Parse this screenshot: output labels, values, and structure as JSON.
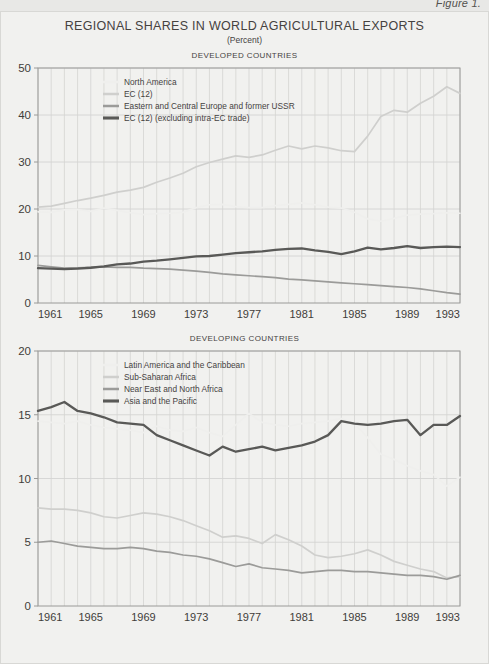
{
  "figure_label": "Figure 1.",
  "title": "REGIONAL SHARES IN WORLD AGRICULTURAL EXPORTS",
  "subtitle": "(Percent)",
  "colors": {
    "very_light": "#efefed",
    "light": "#cfcfcd",
    "medium": "#9b9b99",
    "dark": "#595957",
    "grid": "#d4d4d2",
    "axis": "#9a9a98",
    "text": "#3f3d3a",
    "background": "#f1f1ef",
    "page": "#e8e8e6"
  },
  "chart_data": [
    {
      "type": "line",
      "title": "DEVELOPED COUNTRIES",
      "xlabel": "",
      "ylabel": "",
      "xlim": [
        1961,
        1993
      ],
      "ylim": [
        0,
        50
      ],
      "yticks": [
        0,
        10,
        20,
        30,
        40,
        50
      ],
      "xticks": [
        1961,
        1965,
        1969,
        1973,
        1977,
        1981,
        1985,
        1989,
        1993
      ],
      "grid": true,
      "legend_position": "top-left-inside",
      "x": [
        1961,
        1962,
        1963,
        1964,
        1965,
        1966,
        1967,
        1968,
        1969,
        1970,
        1971,
        1972,
        1973,
        1974,
        1975,
        1976,
        1977,
        1978,
        1979,
        1980,
        1981,
        1982,
        1983,
        1984,
        1985,
        1986,
        1987,
        1988,
        1989,
        1990,
        1991,
        1992,
        1993
      ],
      "series": [
        {
          "name": "North America",
          "color_key": "very_light",
          "values": [
            19.4,
            19.3,
            19.8,
            19.9,
            19.5,
            20.2,
            19.7,
            19.2,
            18.8,
            19.0,
            19.1,
            19.3,
            20.3,
            20.9,
            21.0,
            20.5,
            20.3,
            20.3,
            20.7,
            21.0,
            21.3,
            20.9,
            20.4,
            20.2,
            19.3,
            17.9,
            17.4,
            18.0,
            18.7,
            18.9,
            19.0,
            19.2,
            19.1
          ]
        },
        {
          "name": "EC (12)",
          "color_key": "light",
          "values": [
            20.4,
            20.6,
            21.2,
            21.8,
            22.3,
            22.9,
            23.6,
            24.0,
            24.6,
            25.7,
            26.6,
            27.6,
            29.0,
            29.9,
            30.6,
            31.3,
            31.0,
            31.5,
            32.5,
            33.4,
            32.8,
            33.4,
            33.0,
            32.4,
            32.2,
            35.5,
            39.7,
            41.0,
            40.6,
            42.5,
            44.0,
            46.0,
            44.6
          ]
        },
        {
          "name": "Eastern and Central Europe and former USSR",
          "color_key": "medium",
          "values": [
            8.0,
            7.7,
            7.4,
            7.5,
            7.6,
            7.7,
            7.6,
            7.6,
            7.4,
            7.3,
            7.2,
            7.0,
            6.8,
            6.5,
            6.2,
            6.0,
            5.8,
            5.6,
            5.4,
            5.1,
            4.9,
            4.7,
            4.5,
            4.3,
            4.1,
            3.9,
            3.7,
            3.5,
            3.3,
            3.0,
            2.6,
            2.2,
            1.9
          ]
        },
        {
          "name": "EC (12) (excluding intra-EC trade)",
          "color_key": "dark",
          "values": [
            7.4,
            7.3,
            7.2,
            7.3,
            7.5,
            7.8,
            8.2,
            8.4,
            8.8,
            9.0,
            9.3,
            9.6,
            9.9,
            10.0,
            10.3,
            10.6,
            10.8,
            11.0,
            11.3,
            11.5,
            11.6,
            11.2,
            10.9,
            10.4,
            11.0,
            11.8,
            11.4,
            11.7,
            12.1,
            11.7,
            11.9,
            12.0,
            11.9
          ]
        }
      ]
    },
    {
      "type": "line",
      "title": "DEVELOPING COUNTRIES",
      "xlabel": "",
      "ylabel": "",
      "xlim": [
        1961,
        1993
      ],
      "ylim": [
        0,
        20
      ],
      "yticks": [
        0,
        5,
        10,
        15,
        20
      ],
      "xticks": [
        1961,
        1965,
        1969,
        1973,
        1977,
        1981,
        1985,
        1989,
        1993
      ],
      "grid": true,
      "legend_position": "top-left-inside",
      "x": [
        1961,
        1962,
        1963,
        1964,
        1965,
        1966,
        1967,
        1968,
        1969,
        1970,
        1971,
        1972,
        1973,
        1974,
        1975,
        1976,
        1977,
        1978,
        1979,
        1980,
        1981,
        1982,
        1983,
        1984,
        1985,
        1986,
        1987,
        1988,
        1989,
        1990,
        1991,
        1992,
        1993
      ],
      "series": [
        {
          "name": "Latin America and the Caribbean",
          "color_key": "very_light",
          "values": [
            14.5,
            14.4,
            14.3,
            14.5,
            14.2,
            14.0,
            13.9,
            13.8,
            13.6,
            14.1,
            13.8,
            13.7,
            14.0,
            13.6,
            13.3,
            14.2,
            15.1,
            14.4,
            14.2,
            14.1,
            14.3,
            14.4,
            14.5,
            14.7,
            14.3,
            13.2,
            11.9,
            11.5,
            11.0,
            10.6,
            10.3,
            9.4,
            10.1
          ]
        },
        {
          "name": "Sub-Saharan Africa",
          "color_key": "light",
          "values": [
            7.7,
            7.6,
            7.6,
            7.5,
            7.3,
            7.0,
            6.9,
            7.1,
            7.3,
            7.2,
            7.0,
            6.7,
            6.3,
            5.9,
            5.4,
            5.5,
            5.3,
            4.9,
            5.6,
            5.2,
            4.7,
            4.0,
            3.8,
            3.9,
            4.1,
            4.4,
            4.0,
            3.5,
            3.2,
            2.9,
            2.7,
            2.2,
            2.3
          ]
        },
        {
          "name": "Near East and North Africa",
          "color_key": "medium",
          "values": [
            5.0,
            5.1,
            4.9,
            4.7,
            4.6,
            4.5,
            4.5,
            4.6,
            4.5,
            4.3,
            4.2,
            4.0,
            3.9,
            3.7,
            3.4,
            3.1,
            3.3,
            3.0,
            2.9,
            2.8,
            2.6,
            2.7,
            2.8,
            2.8,
            2.7,
            2.7,
            2.6,
            2.5,
            2.4,
            2.4,
            2.3,
            2.1,
            2.4
          ]
        },
        {
          "name": "Asia and the Pacific",
          "color_key": "dark",
          "values": [
            15.3,
            15.6,
            16.0,
            15.3,
            15.1,
            14.8,
            14.4,
            14.3,
            14.2,
            13.4,
            13.0,
            12.6,
            12.2,
            11.8,
            12.5,
            12.1,
            12.3,
            12.5,
            12.2,
            12.4,
            12.6,
            12.9,
            13.4,
            14.5,
            14.3,
            14.2,
            14.3,
            14.5,
            14.6,
            13.4,
            14.2,
            14.2,
            14.9
          ]
        }
      ]
    }
  ]
}
